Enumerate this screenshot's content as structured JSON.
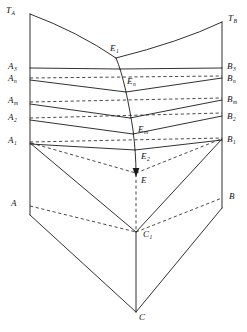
{
  "figure": {
    "background_color": "#ffffff",
    "line_color": "#1a1a1a",
    "width": 247,
    "height": 332
  },
  "labels": {
    "t_a": {
      "base": "T",
      "sub": "A",
      "x": 6,
      "y": 8
    },
    "t_b": {
      "base": "T",
      "sub": "B",
      "x": 228,
      "y": 16
    },
    "a3": {
      "base": "A",
      "sub": "3",
      "x": 6,
      "y": 66
    },
    "a_n": {
      "base": "A",
      "sub": "n",
      "x": 6,
      "y": 80
    },
    "a_m": {
      "base": "A",
      "sub": "m",
      "x": 6,
      "y": 100
    },
    "a2": {
      "base": "A",
      "sub": "2",
      "x": 6,
      "y": 117
    },
    "a1": {
      "base": "A",
      "sub": "1",
      "x": 6,
      "y": 140
    },
    "a": {
      "base": "A",
      "sub": "",
      "x": 10,
      "y": 202
    },
    "b3": {
      "base": "B",
      "sub": "3",
      "x": 228,
      "y": 66
    },
    "b_n": {
      "base": "B",
      "sub": "n",
      "x": 228,
      "y": 80
    },
    "b_m": {
      "base": "B",
      "sub": "m",
      "x": 228,
      "y": 100
    },
    "b2": {
      "base": "B",
      "sub": "2",
      "x": 228,
      "y": 117
    },
    "b1": {
      "base": "B",
      "sub": "1",
      "x": 228,
      "y": 140
    },
    "b": {
      "base": "B",
      "sub": "",
      "x": 230,
      "y": 196
    },
    "e1": {
      "base": "E",
      "sub": "1",
      "x": 110,
      "y": 48
    },
    "e_n": {
      "base": "E",
      "sub": "n",
      "x": 126,
      "y": 80
    },
    "e_m": {
      "base": "E",
      "sub": "m",
      "x": 138,
      "y": 128
    },
    "e2": {
      "base": "E",
      "sub": "2",
      "x": 140,
      "y": 156
    },
    "e": {
      "base": "E",
      "sub": "",
      "x": 140,
      "y": 178
    },
    "c1": {
      "base": "C",
      "sub": "1",
      "x": 146,
      "y": 232
    },
    "c": {
      "base": "C",
      "sub": "",
      "x": 142,
      "y": 310
    }
  },
  "geometry": {
    "left_axis": {
      "x": 30,
      "y_top": 14,
      "y_bottom": 215
    },
    "right_axis": {
      "x": 222,
      "y_top": 22,
      "y_bottom": 208
    },
    "apex_x": 136,
    "levels": [
      {
        "name": "level-T",
        "left_y": 14,
        "right_y": 22,
        "apex_y": 58
      },
      {
        "name": "level-3",
        "left_y": 68,
        "right_y": 68,
        "apex_y": 68
      },
      {
        "name": "level-n",
        "left_y": 78,
        "right_y": 76,
        "apex_y": 92
      },
      {
        "name": "level-m",
        "left_y": 102,
        "right_y": 98,
        "apex_y": 102
      },
      {
        "name": "level-2",
        "left_y": 118,
        "right_y": 113,
        "apex_y": 128
      },
      {
        "name": "level-1",
        "left_y": 142,
        "right_y": 138,
        "apex_y": 146
      },
      {
        "name": "level-0",
        "left_y": 206,
        "right_y": 198,
        "apex_y": 232
      },
      {
        "name": "level-C",
        "left_y": 215,
        "right_y": 208,
        "apex_y": 312
      }
    ],
    "eutectic_curve": [
      {
        "x": 116,
        "y": 58
      },
      {
        "x": 126,
        "y": 92
      },
      {
        "x": 132,
        "y": 128
      },
      {
        "x": 135,
        "y": 146
      },
      {
        "x": 136,
        "y": 172
      }
    ],
    "arrow_tip": {
      "x": 136,
      "y": 174
    }
  },
  "notes": {
    "solid_meaning": "front / visible edges",
    "dashed_meaning": "hidden / rear edges",
    "curve_meaning": "liquidus boundary surface trace"
  }
}
